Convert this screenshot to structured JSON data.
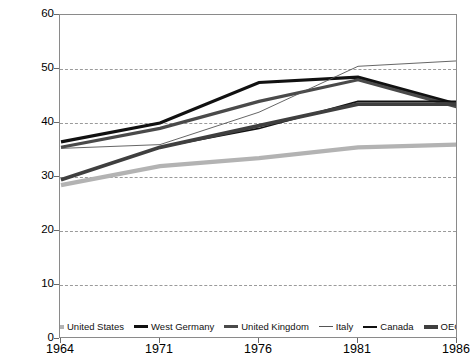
{
  "chart_data": {
    "type": "line",
    "title": "",
    "xlabel": "",
    "ylabel": "Percentage of GNP or GDP",
    "categories": [
      "1964",
      "1971",
      "1976",
      "1981",
      "1986"
    ],
    "ylim": [
      0,
      60
    ],
    "yticks": [
      0,
      10,
      20,
      30,
      40,
      50,
      60
    ],
    "grid": "horizontal-dashed",
    "legend_position": "bottom-inside",
    "series": [
      {
        "name": "United States",
        "values": [
          28.5,
          32.0,
          33.5,
          35.5,
          36.0
        ],
        "color": "#b3b3b3",
        "width": 4.2,
        "legend_style": "thick-gray"
      },
      {
        "name": "West Germany",
        "values": [
          36.5,
          40.0,
          47.5,
          48.5,
          43.5
        ],
        "color": "#111111",
        "width": 3.2,
        "legend_style": "thick-black"
      },
      {
        "name": "United Kingdom",
        "values": [
          35.5,
          39.0,
          44.0,
          48.0,
          43.0
        ],
        "color": "#4a4a4a",
        "width": 3.2,
        "legend_style": "thick-darkgray"
      },
      {
        "name": "Italy",
        "values": [
          35.3,
          36.0,
          42.0,
          50.5,
          51.5
        ],
        "color": "#555555",
        "width": 0.9,
        "legend_style": "thin-gray"
      },
      {
        "name": "Canada",
        "values": [
          29.5,
          35.5,
          39.0,
          44.0,
          44.0
        ],
        "color": "#111111",
        "width": 1.6,
        "legend_style": "medium-black"
      },
      {
        "name": "OECD",
        "values": [
          29.5,
          35.5,
          39.5,
          43.5,
          43.5
        ],
        "color": "#3f3f3f",
        "width": 3.8,
        "legend_style": "thick-darkgray"
      }
    ]
  },
  "axes": {
    "y_tick_labels": [
      "60",
      "50",
      "40",
      "30",
      "20",
      "10",
      "0"
    ],
    "x_tick_labels": [
      "1964",
      "1971",
      "1976",
      "1981",
      "1986"
    ],
    "y_axis_title": "Percentage of GNP or GDP"
  },
  "legend": {
    "items": [
      {
        "label": "United States"
      },
      {
        "label": "West Germany"
      },
      {
        "label": "United Kingdom"
      },
      {
        "label": "Italy"
      },
      {
        "label": "Canada"
      },
      {
        "label": "OECD"
      }
    ]
  },
  "colors": {
    "background": "#ffffff",
    "axis": "#8a8a8a",
    "grid": "#9a9a9a",
    "text": "#000000"
  }
}
